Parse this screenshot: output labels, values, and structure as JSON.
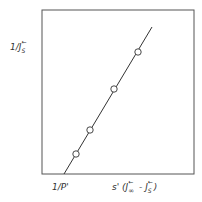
{
  "chart_data": {
    "type": "line",
    "title": "",
    "ylabel": "1/J_S^←",
    "xlabel": "s'(J_∞^← - J_S^←)",
    "x_intercept_label": "1/P'",
    "grid": false,
    "legend": null,
    "axis_ticks": "none (schematic)",
    "frame": {
      "x0": 42,
      "y0": 10,
      "x1": 194,
      "y1": 174
    },
    "line": {
      "x_start": 64,
      "y_start": 174,
      "x_end": 152,
      "y_end": 27
    },
    "points_px": [
      {
        "x": 76,
        "y": 154
      },
      {
        "x": 90,
        "y": 130
      },
      {
        "x": 114,
        "y": 89
      },
      {
        "x": 138,
        "y": 52
      }
    ],
    "points_normalized": [
      {
        "x": 0.22,
        "y": 0.12
      },
      {
        "x": 0.32,
        "y": 0.27
      },
      {
        "x": 0.47,
        "y": 0.52
      },
      {
        "x": 0.63,
        "y": 0.74
      }
    ],
    "marker": "open-circle",
    "line_color": "#333333"
  },
  "labels": {
    "y_main": "1/J",
    "y_sub": "S",
    "y_sup": "←",
    "x_left": "1/P'",
    "x_right_prefix": "s' (J",
    "x_right_sub1": "∞",
    "x_right_sup1": "←",
    "x_right_mid": " - J",
    "x_right_sub2": "S",
    "x_right_sup2": "←",
    "x_right_suffix": ")"
  }
}
